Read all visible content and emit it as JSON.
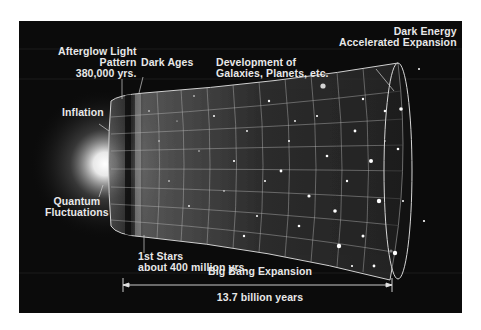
{
  "labels": {
    "afterglow": [
      "Afterglow Light",
      "Pattern",
      "380,000 yrs."
    ],
    "dark_ages": "Dark Ages",
    "development": [
      "Development of",
      "Galaxies, Planets, etc."
    ],
    "dark_energy": [
      "Dark Energy",
      "Accelerated Expansion"
    ],
    "inflation": "Inflation",
    "quantum": [
      "Quantum",
      "Fluctuations"
    ],
    "first_stars": [
      "1st Stars",
      "about 400 million yrs."
    ],
    "expansion": "Big Bang Expansion",
    "duration": "13.7 billion years"
  },
  "colors": {
    "background": "#0b0b0b",
    "text": "#e8e8e8",
    "grid": "#bdbdbd",
    "glow": "#ffffff"
  }
}
